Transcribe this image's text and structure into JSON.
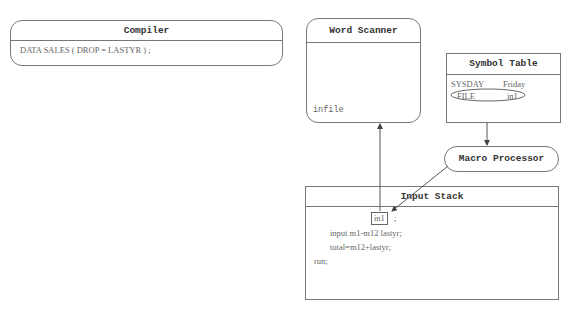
{
  "compiler": {
    "title": "Compiler",
    "code": "DATA SALES ( DROP = LASTYR ) ;"
  },
  "word_scanner": {
    "title": "Word Scanner",
    "token": "infile"
  },
  "symbol_table": {
    "title": "Symbol Table",
    "rows": [
      {
        "name": "SYSDAY",
        "value": "Friday"
      },
      {
        "name": "FILE",
        "value": "in1"
      }
    ]
  },
  "macro_processor": {
    "title": "Macro Processor"
  },
  "input_stack": {
    "title": "Input Stack",
    "highlight": "in1",
    "after_highlight": ";",
    "lines": [
      "input m1-m12 lastyr;",
      "total=m12+lastyr;",
      "run;"
    ]
  }
}
